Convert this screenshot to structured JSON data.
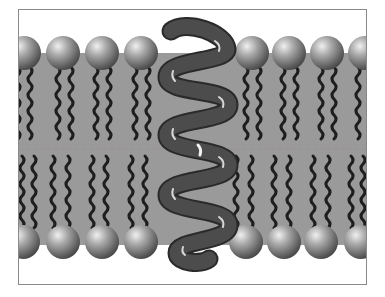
{
  "diagram": {
    "title": "",
    "colors": {
      "background": "#ffffff",
      "membrane_core": "#9a9a9a",
      "lipid_head": "#7a7a7a",
      "lipid_tail": "#1e1e1e",
      "protein": "#4a4a4a",
      "frame": "#8a8a8a"
    },
    "components": [
      {
        "name": "phospholipid-head",
        "count_top": 8,
        "count_bottom": 8
      },
      {
        "name": "fatty-acid-tail",
        "per_lipid": 2
      },
      {
        "name": "transmembrane-protein",
        "shape": "coiled helix",
        "turns": 7
      }
    ],
    "labels": []
  }
}
